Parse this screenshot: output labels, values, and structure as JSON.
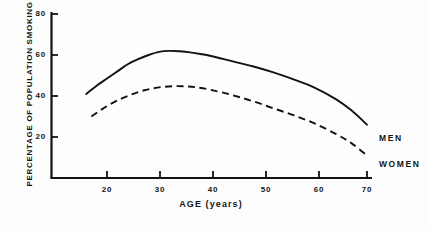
{
  "chart_data": {
    "type": "line",
    "title": "",
    "xlabel": "AGE (years)",
    "ylabel": "PERCENTAGE OF POPULATION SMOKING",
    "xlim": [
      13,
      71
    ],
    "ylim": [
      0,
      84
    ],
    "grid": false,
    "legend_position": "right-inline-labels",
    "x_ticks": [
      20,
      30,
      40,
      50,
      60,
      70
    ],
    "y_ticks": [
      20,
      40,
      60,
      80
    ],
    "series": [
      {
        "name": "MEN",
        "style": "solid",
        "color": "#121212",
        "x": [
          16,
          18,
          20,
          22,
          24,
          26,
          28,
          30,
          32,
          34,
          36,
          38,
          40,
          44,
          48,
          52,
          56,
          60,
          64,
          67,
          70
        ],
        "values": [
          41,
          45,
          48.5,
          52,
          55.5,
          58,
          60,
          61.5,
          62,
          61.8,
          61.3,
          60.5,
          59.5,
          57,
          54.5,
          51.5,
          48,
          44,
          38.5,
          33,
          26
        ]
      },
      {
        "name": "WOMEN",
        "style": "dashed",
        "color": "#121212",
        "x": [
          17,
          19,
          21,
          23,
          25,
          27,
          29,
          31,
          33,
          35,
          37,
          40,
          44,
          48,
          52,
          56,
          60,
          64,
          67,
          70
        ],
        "values": [
          30,
          33.5,
          36.5,
          39,
          41,
          42.7,
          43.8,
          44.5,
          44.8,
          44.7,
          44.3,
          43,
          40.5,
          37.5,
          34,
          30.5,
          26.5,
          21.5,
          17,
          11
        ]
      }
    ],
    "annotations": [
      {
        "text": "MEN",
        "series": "MEN"
      },
      {
        "text": "WOMEN",
        "series": "WOMEN"
      }
    ]
  },
  "axes": {
    "x_tick_labels": [
      "20",
      "30",
      "40",
      "50",
      "60",
      "70"
    ],
    "y_tick_labels": [
      "80",
      "60",
      "40",
      "20"
    ],
    "x_title": "AGE (years)",
    "y_title": "PERCENTAGE OF POPULATION SMOKING"
  },
  "labels": {
    "men": "MEN",
    "women": "WOMEN"
  },
  "caption": {
    "text": ""
  }
}
